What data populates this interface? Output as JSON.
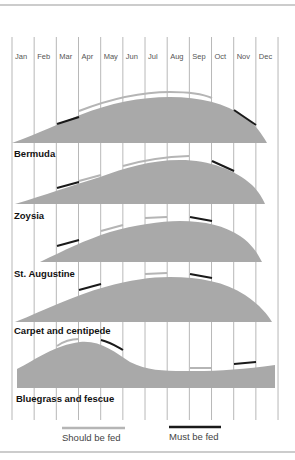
{
  "chart_data": {
    "type": "area",
    "title": "",
    "xlabel": "",
    "ylabel": "",
    "months": [
      "Jan",
      "Feb",
      "Mar",
      "Apr",
      "May",
      "Jun",
      "Jul",
      "Aug",
      "Sep",
      "Oct",
      "Nov",
      "Dec"
    ],
    "grid": true,
    "legend": {
      "position": "bottom",
      "entries": [
        {
          "label": "Should be fed",
          "color": "#b5b5b5"
        },
        {
          "label": "Must be fed",
          "color": "#1a1a1a"
        }
      ]
    },
    "colors": {
      "fill": "#a9a9a9",
      "should": "#b5b5b5",
      "must": "#1a1a1a",
      "gridline": "#888888"
    },
    "series": [
      {
        "name": "Bermuda",
        "description": "Growth curve rising from Jan, peaking Aug, ending late Nov",
        "growth_profile": [
          0,
          0.12,
          0.38,
          0.6,
          0.78,
          0.9,
          0.97,
          1.0,
          0.97,
          0.85,
          0.4,
          0
        ],
        "should_be_fed": [
          "Apr",
          "May",
          "Jun",
          "Jul",
          "Aug",
          "Sep"
        ],
        "must_be_fed": [
          "Mar",
          "Oct"
        ]
      },
      {
        "name": "Zoysia",
        "description": "Growth curve rising from Jan, peaking Aug, ending late Nov",
        "growth_profile": [
          0,
          0.15,
          0.38,
          0.58,
          0.75,
          0.9,
          0.98,
          1.0,
          0.94,
          0.78,
          0.4,
          0
        ],
        "should_be_fed": [
          "Apr",
          "Jun",
          "Jul",
          "Aug"
        ],
        "must_be_fed": [
          "Mar",
          "Oct"
        ]
      },
      {
        "name": "St. Augustine",
        "description": "Growth curve starting Feb, peaking Aug, ending late Nov",
        "growth_profile": [
          0,
          0.05,
          0.3,
          0.55,
          0.75,
          0.9,
          0.98,
          1.0,
          0.95,
          0.78,
          0.4,
          0
        ],
        "should_be_fed": [
          "May",
          "Jul"
        ],
        "must_be_fed": [
          "Mar",
          "Sep"
        ]
      },
      {
        "name": "Carpet and centipede",
        "description": "Growth curve rising from Jan, peaking Aug, ending Dec",
        "growth_profile": [
          0,
          0.2,
          0.42,
          0.62,
          0.8,
          0.92,
          0.98,
          1.0,
          0.97,
          0.88,
          0.6,
          0
        ],
        "should_be_fed": [
          "Jul"
        ],
        "must_be_fed": [
          "Apr",
          "Sep"
        ]
      },
      {
        "name": "Bluegrass and fescue",
        "description": "Cool-season: high in spring (peak Apr), dip in summer, moderate recovery in fall",
        "growth_profile": [
          0.6,
          0.8,
          0.95,
          1.0,
          0.9,
          0.55,
          0.35,
          0.25,
          0.22,
          0.24,
          0.3,
          0.36
        ],
        "should_be_fed": [
          "Mar",
          "Sep"
        ],
        "must_be_fed": [
          "Apr",
          "Nov"
        ]
      }
    ]
  },
  "legend_labels": {
    "should": "Should be fed",
    "must": "Must be fed"
  }
}
